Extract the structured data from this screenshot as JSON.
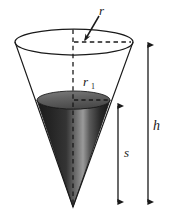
{
  "figure": {
    "kind": "geometry-diagram",
    "background_color": "#ffffff",
    "ink_color": "#1a1a1a",
    "fill_color_dark": "#2b2b2b",
    "fill_color_mid": "#6e6e6e",
    "fill_color_light": "#b8b8b8"
  },
  "labels": {
    "radius_top": "r",
    "radius_inner_base": "r",
    "radius_inner_sub": "1",
    "slant_or_depth": "s",
    "height": "h"
  },
  "geometry": {
    "cone_top_ellipse": {
      "cx": 74,
      "cy": 42,
      "rx": 59,
      "ry": 13
    },
    "liquid_ellipse": {
      "cx": 73.5,
      "cy": 100,
      "rx": 36.5,
      "ry": 9
    },
    "apex": {
      "x": 73,
      "y": 207
    },
    "axis_line": {
      "x": 73,
      "y_top": 42,
      "y_bottom": 207
    },
    "radius_dashed_top": {
      "y": 42,
      "x_from": 74,
      "x_to": 131
    },
    "radius_dashed_inner": {
      "y": 100,
      "x_from": 74,
      "x_to": 109
    },
    "arrow_s": {
      "x": 118,
      "y_top": 103,
      "y_bottom": 206
    },
    "arrow_h": {
      "x": 148,
      "y_top": 41,
      "y_bottom": 206
    },
    "leader_r": {
      "x_from": 97,
      "y_from": 18,
      "x_to": 85,
      "y_to": 40
    }
  }
}
